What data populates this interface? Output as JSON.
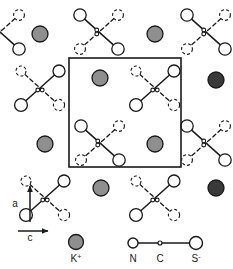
{
  "figure": {
    "type": "crystal-structure-projection",
    "title": "",
    "background_color": "#ffffff"
  },
  "colors": {
    "line": "#1a1a1a",
    "potassium_fill": "#8f8f8f",
    "potassium_fill_dark": "#3a3a3a",
    "potassium_stroke": "#1a1a1a",
    "atom_fill": "#ffffff",
    "atom_stroke": "#1a1a1a",
    "cell_stroke": "#1a1a1a"
  },
  "axes": {
    "vertical": {
      "label": "a",
      "icon": "arrow-up-icon",
      "x": 30,
      "y_start": 222,
      "y_end": 186,
      "label_x": 15,
      "label_y": 207
    },
    "horizontal": {
      "label": "c",
      "icon": "arrow-right-icon",
      "x_start": 18,
      "x_end": 48,
      "y": 231,
      "label_x": 30,
      "label_y": 241
    }
  },
  "unit_cell": {
    "label": "unit-cell-box",
    "x": 69,
    "y": 58,
    "width": 112,
    "height": 109,
    "stroke_width": 1.6
  },
  "legend": {
    "potassium": {
      "label": "K",
      "charge": "+",
      "symbol": "filled-gray-circle",
      "circle_x": 76,
      "circle_y": 242,
      "radius": 7.5,
      "text_x": 76,
      "text_y": 262
    },
    "thiocyanate": {
      "nitrogen": {
        "label": "N",
        "symbol": "open-circle",
        "x": 133,
        "y": 243,
        "radius": 5.0,
        "text_x": 133,
        "text_y": 262
      },
      "carbon": {
        "label": "C",
        "symbol": "small-dot",
        "x": 160,
        "y": 243,
        "radius": 2.0,
        "text_x": 160,
        "text_y": 262
      },
      "sulfur": {
        "label": "S",
        "charge": "-",
        "symbol": "open-circle",
        "x": 196,
        "y": 243,
        "radius": 6.5,
        "text_x": 196,
        "text_y": 262
      },
      "bond_stroke_width": 1.6
    }
  },
  "potassium_ions": [
    {
      "x": 40,
      "y": 34,
      "r": 8.0,
      "shade": "mid"
    },
    {
      "x": 155,
      "y": 34,
      "r": 8.0,
      "shade": "mid"
    },
    {
      "x": 100,
      "y": 78,
      "r": 8.0,
      "shade": "mid"
    },
    {
      "x": 216,
      "y": 80,
      "r": 8.0,
      "shade": "dark"
    },
    {
      "x": 45,
      "y": 144,
      "r": 8.0,
      "shade": "mid"
    },
    {
      "x": 155,
      "y": 144,
      "r": 8.0,
      "shade": "mid"
    },
    {
      "x": 101,
      "y": 188,
      "r": 8.0,
      "shade": "mid"
    },
    {
      "x": 216,
      "y": 188,
      "r": 8.0,
      "shade": "dark"
    }
  ],
  "thiocyanate_crosses": [
    {
      "name": "cross-top-1",
      "cx": 99,
      "cy": 32,
      "orientation": "solid-nw-se",
      "solid": {
        "end_a": {
          "dx": -19,
          "dy": -17,
          "r": 6.2,
          "atom": "N"
        },
        "end_b": {
          "dx": 19,
          "dy": 17,
          "r": 6.2,
          "atom": "S"
        }
      },
      "dashed": {
        "end_a": {
          "dx": 19,
          "dy": -17,
          "r": 5.4,
          "atom": "N"
        },
        "end_b": {
          "dx": -19,
          "dy": 17,
          "r": 5.4,
          "atom": "S"
        }
      }
    },
    {
      "name": "cross-top-2",
      "cx": 206,
      "cy": 32,
      "orientation": "solid-nw-se",
      "solid": {
        "end_a": {
          "dx": -19,
          "dy": -17,
          "r": 6.2,
          "atom": "N"
        },
        "end_b": {
          "dx": 19,
          "dy": 17,
          "r": 6.2,
          "atom": "S"
        }
      },
      "dashed": {
        "end_a": {
          "dx": 19,
          "dy": -17,
          "r": 5.4,
          "atom": "N"
        },
        "end_b": {
          "dx": -19,
          "dy": 17,
          "r": 5.4,
          "atom": "S"
        }
      }
    },
    {
      "name": "cross-left-mid",
      "cx": 40,
      "cy": 88,
      "orientation": "solid-sw-ne",
      "solid": {
        "end_a": {
          "dx": -19,
          "dy": 17,
          "r": 6.4,
          "atom": "S"
        },
        "end_b": {
          "dx": 19,
          "dy": -17,
          "r": 6.0,
          "atom": "N"
        }
      },
      "dashed": {
        "end_a": {
          "dx": -19,
          "dy": -17,
          "r": 5.0,
          "atom": "N"
        },
        "end_b": {
          "dx": 19,
          "dy": 17,
          "r": 5.6,
          "atom": "S"
        }
      }
    },
    {
      "name": "cross-cell-upper-right",
      "cx": 155,
      "cy": 88,
      "orientation": "solid-sw-ne",
      "solid": {
        "end_a": {
          "dx": -19,
          "dy": 17,
          "r": 6.4,
          "atom": "S"
        },
        "end_b": {
          "dx": 19,
          "dy": -17,
          "r": 6.0,
          "atom": "N"
        }
      },
      "dashed": {
        "end_a": {
          "dx": -19,
          "dy": -17,
          "r": 5.0,
          "atom": "N"
        },
        "end_b": {
          "dx": 19,
          "dy": 17,
          "r": 5.6,
          "atom": "S"
        }
      }
    },
    {
      "name": "cross-cell-lower-left",
      "cx": 100,
      "cy": 143,
      "orientation": "solid-nw-se",
      "solid": {
        "end_a": {
          "dx": -19,
          "dy": -17,
          "r": 6.2,
          "atom": "N"
        },
        "end_b": {
          "dx": 19,
          "dy": 17,
          "r": 6.2,
          "atom": "S"
        }
      },
      "dashed": {
        "end_a": {
          "dx": 19,
          "dy": -17,
          "r": 5.4,
          "atom": "N"
        },
        "end_b": {
          "dx": -19,
          "dy": 17,
          "r": 5.4,
          "atom": "S"
        }
      }
    },
    {
      "name": "cross-right-mid",
      "cx": 206,
      "cy": 143,
      "orientation": "solid-nw-se",
      "solid": {
        "end_a": {
          "dx": -19,
          "dy": -17,
          "r": 6.2,
          "atom": "N"
        },
        "end_b": {
          "dx": 19,
          "dy": 17,
          "r": 6.2,
          "atom": "S"
        }
      },
      "dashed": {
        "end_a": {
          "dx": 19,
          "dy": -17,
          "r": 5.4,
          "atom": "N"
        },
        "end_b": {
          "dx": -19,
          "dy": 17,
          "r": 5.4,
          "atom": "S"
        }
      }
    },
    {
      "name": "cross-bottom-1",
      "cx": 45,
      "cy": 198,
      "orientation": "solid-sw-ne",
      "solid": {
        "end_a": {
          "dx": -19,
          "dy": 17,
          "r": 6.4,
          "atom": "S"
        },
        "end_b": {
          "dx": 19,
          "dy": -17,
          "r": 6.0,
          "atom": "N"
        }
      },
      "dashed": {
        "end_a": {
          "dx": -19,
          "dy": -17,
          "r": 5.0,
          "atom": "N"
        },
        "end_b": {
          "dx": 19,
          "dy": 17,
          "r": 5.6,
          "atom": "S"
        }
      }
    },
    {
      "name": "cross-bottom-2",
      "cx": 155,
      "cy": 198,
      "orientation": "solid-sw-ne",
      "solid": {
        "end_a": {
          "dx": -19,
          "dy": 17,
          "r": 6.4,
          "atom": "S"
        },
        "end_b": {
          "dx": 19,
          "dy": -17,
          "r": 6.0,
          "atom": "N"
        }
      },
      "dashed": {
        "end_a": {
          "dx": -19,
          "dy": -17,
          "r": 5.0,
          "atom": "N"
        },
        "end_b": {
          "dx": 19,
          "dy": 17,
          "r": 5.6,
          "atom": "S"
        }
      }
    },
    {
      "name": "cross-partial-top-left-clip",
      "cx": 0,
      "cy": 32,
      "orientation": "solid-nw-se",
      "partial": true,
      "solid": {
        "end_a": {
          "dx": -19,
          "dy": -17,
          "r": 6.2,
          "atom": "N"
        },
        "end_b": {
          "dx": 19,
          "dy": 17,
          "r": 6.2,
          "atom": "S"
        }
      },
      "dashed": {
        "end_a": {
          "dx": 19,
          "dy": -17,
          "r": 5.4,
          "atom": "N"
        },
        "end_b": {
          "dx": -19,
          "dy": 17,
          "r": 5.4,
          "atom": "S"
        }
      }
    }
  ],
  "bond_style": {
    "solid_stroke_width": 1.5,
    "dashed_stroke_width": 1.3,
    "dash_pattern": "4,3",
    "carbon_dot_radius": 1.9,
    "carbon_offset": 3.0
  }
}
